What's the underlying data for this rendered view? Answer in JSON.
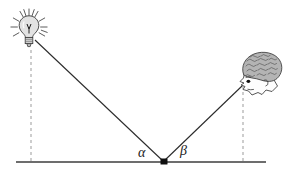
{
  "figure": {
    "type": "optics-reflection-diagram",
    "background_color": "#ffffff",
    "line_color": "#2b2b2b",
    "dashed_color": "#8c8c8c",
    "ground_color": "#4a4a4a"
  },
  "labels": {
    "alpha": "α",
    "beta": "β"
  },
  "objects": {
    "lamp": {
      "name": "light-bulb",
      "position": {
        "x": 32,
        "y": 36
      },
      "ray_count": 12,
      "color": "#d9d9d9",
      "outline": "#3a3a3a"
    },
    "observer": {
      "name": "observer-head",
      "position": {
        "x": 252,
        "y": 70
      },
      "eye": {
        "x": 244,
        "y": 84
      },
      "hair_color": "#9a9a9a",
      "skin_color": "#fdfdfd",
      "outline": "#3a3a3a"
    }
  },
  "geometry": {
    "ground_line": {
      "x1": 16,
      "y1": 162,
      "x2": 266,
      "y2": 162
    },
    "vertex": {
      "x": 164,
      "y": 162
    },
    "incident_ray": {
      "x1": 34,
      "y1": 39,
      "x2": 164,
      "y2": 162
    },
    "reflected_ray": {
      "x1": 164,
      "y1": 162,
      "x2": 243,
      "y2": 85
    },
    "lamp_drop_line": {
      "x": 31,
      "y1": 52,
      "y2": 162
    },
    "observer_drop_line": {
      "x": 243,
      "y1": 86,
      "y2": 162
    }
  }
}
